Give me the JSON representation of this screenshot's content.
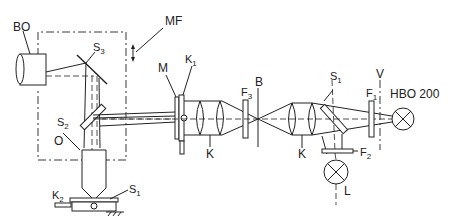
{
  "diagram": {
    "type": "optical-schematic",
    "labels": {
      "bo": "BO",
      "mf": "MF",
      "s3": "S",
      "s3_sub": "3",
      "s2": "S",
      "s2_sub": "2",
      "o": "O",
      "k2": "K",
      "k2_sub": "2",
      "s1_stage": "S",
      "s1_stage_sub": "1",
      "m": "M",
      "k1": "K",
      "k1_sub": "1",
      "f3": "F",
      "f3_sub": "3",
      "b": "B",
      "k_left": "K",
      "k_right": "K",
      "s1_splitter": "S",
      "s1_splitter_sub": "1",
      "f1": "F",
      "f1_sub": "1",
      "v": "V",
      "hbo": "HBO  200",
      "f2": "F",
      "f2_sub": "2",
      "l": "L"
    },
    "colors": {
      "line": "#222222",
      "background": "#ffffff"
    }
  }
}
